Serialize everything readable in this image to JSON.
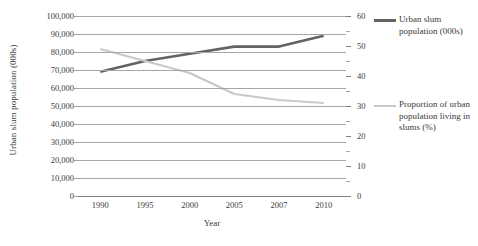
{
  "chart_data": {
    "type": "line",
    "title": "",
    "xlabel": "Year",
    "ylabel": "Urban slum population (000s)",
    "ylabel_secondary": "Proportion of urban population living in slums (%)",
    "categories": [
      "1990",
      "1995",
      "2000",
      "2005",
      "2007",
      "2010"
    ],
    "ylim": [
      0,
      100000
    ],
    "yticks": [
      "100,000",
      "90,000",
      "80,000",
      "70,000",
      "60,000",
      "50,000",
      "40,000",
      "30,000",
      "20,000",
      "10,000",
      "0"
    ],
    "ytick_values": [
      100000,
      90000,
      80000,
      70000,
      60000,
      50000,
      40000,
      30000,
      20000,
      10000,
      0
    ],
    "ylim_secondary": [
      0,
      60
    ],
    "yticks_secondary": [
      "60",
      "50",
      "40",
      "30",
      "20",
      "10",
      "0"
    ],
    "ytick_values_secondary": [
      60,
      50,
      40,
      30,
      20,
      10,
      0
    ],
    "ytick_minor_secondary": [
      55,
      45,
      35,
      25,
      15,
      5
    ],
    "grid": true,
    "legend_position": "right",
    "series": [
      {
        "name": "Urban slum population (000s)",
        "axis": "left",
        "color": "#636363",
        "width": 2.6,
        "values": [
          69000,
          75000,
          79000,
          83000,
          83000,
          89000
        ]
      },
      {
        "name": "Proportion of urban population living in slums (%)",
        "axis": "right",
        "color": "#c9c9c9",
        "width": 2.2,
        "values": [
          49,
          45,
          41,
          34,
          32,
          31
        ]
      }
    ]
  },
  "legend": {
    "items": [
      {
        "label": "Urban slum population (000s)"
      },
      {
        "label": "Proportion of urban population living in slums (%)"
      }
    ]
  }
}
